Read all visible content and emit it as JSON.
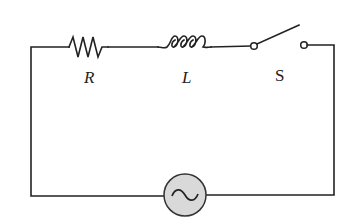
{
  "diagram": {
    "type": "series RLC-like circuit (resistor, inductor, switch, AC source)",
    "labels": {
      "resistor": "R",
      "inductor": "L",
      "switch": "S"
    },
    "components": [
      {
        "id": "resistor",
        "symbol": "zigzag",
        "label": "R"
      },
      {
        "id": "inductor",
        "symbol": "coil",
        "label": "L"
      },
      {
        "id": "switch",
        "symbol": "open-switch",
        "label": "S",
        "state": "open"
      },
      {
        "id": "ac-source",
        "symbol": "circle-with-sine",
        "label": ""
      }
    ],
    "colors": {
      "wire": "#222222",
      "source_fill": "#d9d9d9",
      "background": "#ffffff"
    }
  }
}
